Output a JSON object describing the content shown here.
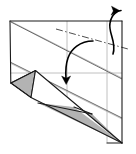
{
  "figure": {
    "kind": "origami-fold-diagram",
    "title": "",
    "caption": "",
    "step_number": "",
    "background_color": "#ffffff",
    "canvas": {
      "width": 136,
      "height": 154
    }
  },
  "palette": {
    "paper_front": "#ffffff",
    "paper_back_shaded": "#b3b3b3",
    "outline": "#1a1a1a",
    "crease_existing": "#b0b0b0",
    "mountain_fold": "#4d4d4d",
    "arrow": "#000000"
  },
  "geometry": {
    "sheet_outline": "10,21 122,21 122,143 10,83",
    "body_outline": "10,21 122,21 122,143 31,97 11,83",
    "shaded_triangle_left": "11,83 35,71 31,97",
    "shaded_flap_lower": "31,97 68,108 122,143 37,103",
    "flap_outline_upper": "35,71 68,108 122,143 31,97",
    "flap_edge_left": "11,83 35,71",
    "flap_edge_bottom": "31,97 122,143"
  },
  "lines": {
    "existing_creases": [
      {
        "name": "crease-diagonal-upper-left",
        "from": "10,21",
        "to": "122,78"
      },
      {
        "name": "crease-diagonal-lower-left",
        "from": "10,63",
        "to": "122,118"
      },
      {
        "name": "crease-vertical-center",
        "from": "67,21",
        "to": "67,112"
      },
      {
        "name": "crease-horizontal-mid",
        "from": "10,73",
        "to": "122,73"
      },
      {
        "name": "crease-vertical-right",
        "from": "107,21",
        "to": "107,143"
      }
    ],
    "fold_lines": [
      {
        "name": "mountain-fold-dash-dot",
        "style": "dash-dot",
        "from": "56,30",
        "to": "126,49"
      }
    ],
    "edges": [
      {
        "name": "edge-top",
        "from": "10,21",
        "to": "122,21"
      },
      {
        "name": "edge-right",
        "from": "122,21",
        "to": "122,143"
      },
      {
        "name": "edge-left",
        "from": "10,21",
        "to": "10,83"
      },
      {
        "name": "edge-bottom-right",
        "from": "107,143",
        "to": "122,143"
      },
      {
        "name": "fold-diagonal-black",
        "from": "35,71",
        "to": "122,143"
      },
      {
        "name": "fold-diagonal-black-2",
        "from": "10,83",
        "to": "35,71"
      },
      {
        "name": "fold-diagonal-black-3",
        "from": "31,97",
        "to": "122,143"
      },
      {
        "name": "fold-diagonal-black-4",
        "from": "11,83",
        "to": "31,97"
      }
    ]
  },
  "arrows": [
    {
      "name": "fold-behind-arrow",
      "description": "curved arrow from inside sheet curling up and over the top edge, pointing left",
      "path": "M 113,52 C 116,40 109,32 110,22 C 111,14 117,10 120,10",
      "head_at": "111,9",
      "head_angle_deg": 200,
      "direction": "up-and-over-to-left"
    },
    {
      "name": "fold-down-arrow",
      "description": "curved arrow from right-center sweeping down-left, pointing down",
      "path": "M 92,41 C 80,41 72,48 68,58 C 65,65 65,72 66,79",
      "head_at": "66,83",
      "head_angle_deg": 95,
      "direction": "down"
    }
  ],
  "labels": []
}
